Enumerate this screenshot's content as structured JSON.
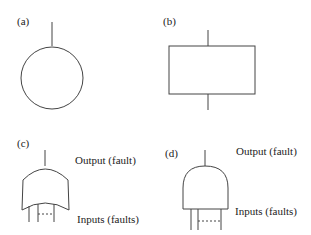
{
  "figure": {
    "panels": [
      {
        "id": "a",
        "label": "(a)",
        "symbol": "circle"
      },
      {
        "id": "b",
        "label": "(b)",
        "symbol": "rectangle"
      },
      {
        "id": "c",
        "label": "(c)",
        "symbol": "or-gate",
        "output_label": "Output (fault)",
        "inputs_label": "Inputs (faults)"
      },
      {
        "id": "d",
        "label": "(d)",
        "symbol": "and-gate",
        "output_label": "Output (fault)",
        "inputs_label": "Inputs (faults)"
      }
    ]
  },
  "colors": {
    "stroke": "#444444",
    "text": "#222222",
    "background": "#ffffff"
  }
}
